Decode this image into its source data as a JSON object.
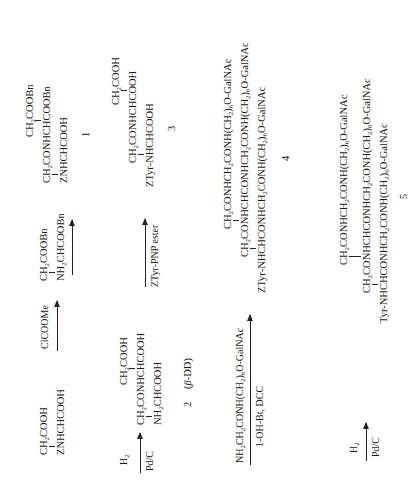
{
  "scheme": {
    "orientation": "rotated 90 degrees counter-clockwise",
    "row1": {
      "start": {
        "top": "CH2COOH",
        "bottom": "ZNHCHCOOH"
      },
      "arrow1_reagent": "ClCOOMe",
      "reagent_compound": {
        "top": "CH2COOBn",
        "bottom": "NH2CHCOOBn"
      },
      "product1": {
        "top": "CH2COOBn",
        "middle": "CH2CONHCHCOOBn",
        "bottom": "ZNHCHCOOH"
      },
      "product1_label": "1"
    },
    "row2": {
      "arrow_reagent_top": "H2",
      "arrow_reagent_bottom": "Pd/C",
      "compound2": {
        "top": "CH2COOH",
        "middle": "CH2CONHCHCOOH",
        "bottom": "NH2CHCOOH"
      },
      "compound2_label": "2",
      "compound2_name": "(β-DD)",
      "arrow2_reagent": "ZTyr-PNP ester",
      "compound3": {
        "top": "CH2COOH",
        "middle": "CH2CONHCHCOOH",
        "bottom": "ZTyr-NHCHCOOH"
      },
      "compound3_label": "3"
    },
    "row3": {
      "arrow_reagent_top": "NH2CH2CONH(CH2)6O-GalNAc",
      "arrow_reagent_bottom": "1-OH-Bt, DCC",
      "compound4": {
        "top": "CH2CONHCH2CONH(CH2)6O-GalNAc",
        "middle": "CH2CONHCHCONHCH2CONH(CH2)6O-GalNAc",
        "bottom": "ZTyr-NHCHCONHCH2CONH(CH2)6O-GalNAc"
      },
      "compound4_label": "4"
    },
    "row4": {
      "arrow_reagent_top": "H2",
      "arrow_reagent_bottom": "Pd/C",
      "compound5": {
        "top": "CH2CONHCH2CONH(CH2)6O-GalNAc",
        "middle": "CH2CONHCHCONHCH2CONH(CH2)6O-GalNAc",
        "bottom": "Tyr-NHCHCONHCH2CONH(CH2)6O-GalNAc"
      },
      "compound5_label": "5"
    }
  }
}
